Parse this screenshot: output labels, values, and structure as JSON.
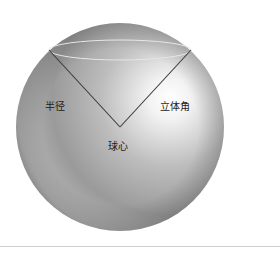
{
  "diagram": {
    "title": "",
    "labels": {
      "radius": "半径",
      "solid_angle": "立体角",
      "sphere_center": "球心"
    },
    "colors": {
      "background": "#ffffff",
      "sphere_highlight": "#ffffff",
      "sphere_mid": "#b0b0b0",
      "sphere_dark": "#6e6e6e",
      "cone_lines": "#3a3a3a",
      "ellipse": "#e6e6e6",
      "bottom_rule": "#cfcfcf"
    },
    "geometry": {
      "sphere": {
        "cx": 120,
        "cy": 127,
        "r": 104
      },
      "cone_apex": {
        "x": 120,
        "y": 127
      },
      "cap_ellipse": {
        "cx": 120,
        "cy": 50,
        "rx": 71,
        "ry": 10
      }
    }
  }
}
